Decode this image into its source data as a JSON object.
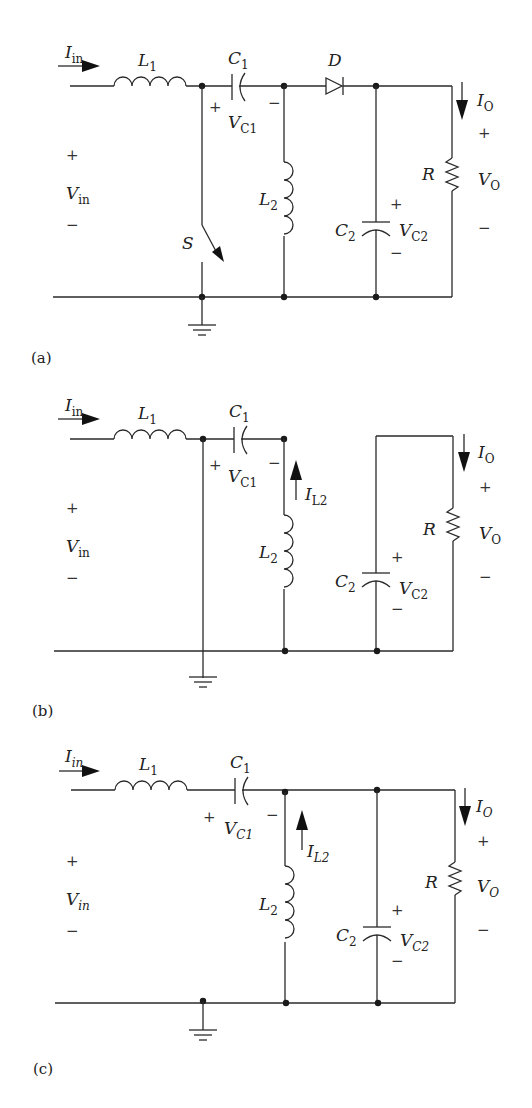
{
  "figure": {
    "panels": [
      {
        "id": "a",
        "caption": "(a)",
        "labels": {
          "iin": "I",
          "iin_sub": "in",
          "l1": "L",
          "l1_sub": "1",
          "c1": "C",
          "c1_sub": "1",
          "vc1": "V",
          "vc1_sub": "C1",
          "d": "D",
          "io": "I",
          "io_sub": "O",
          "r": "R",
          "vo": "V",
          "vo_sub": "O",
          "vin": "V",
          "vin_sub": "in",
          "s": "S",
          "l2": "L",
          "l2_sub": "2",
          "c2": "C",
          "c2_sub": "2",
          "vc2": "V",
          "vc2_sub": "C2",
          "plus": "+",
          "minus": "−"
        }
      },
      {
        "id": "b",
        "caption": "(b)",
        "labels": {
          "iin": "I",
          "iin_sub": "in",
          "l1": "L",
          "l1_sub": "1",
          "c1": "C",
          "c1_sub": "1",
          "vc1": "V",
          "vc1_sub": "C1",
          "il2": "I",
          "il2_sub": "L2",
          "io": "I",
          "io_sub": "O",
          "r": "R",
          "vo": "V",
          "vo_sub": "O",
          "vin": "V",
          "vin_sub": "in",
          "l2": "L",
          "l2_sub": "2",
          "c2": "C",
          "c2_sub": "2",
          "vc2": "V",
          "vc2_sub": "C2",
          "plus": "+",
          "minus": "−"
        }
      },
      {
        "id": "c",
        "caption": "(c)",
        "labels": {
          "iin": "I",
          "iin_sub": "in",
          "l1": "L",
          "l1_sub": "1",
          "c1": "C",
          "c1_sub": "1",
          "vc1": "V",
          "vc1_sub": "C1",
          "il2": "I",
          "il2_sub": "L2",
          "io": "I",
          "io_sub": "O",
          "r": "R",
          "vo": "V",
          "vo_sub": "O",
          "vin": "V",
          "vin_sub": "in",
          "l2": "L",
          "l2_sub": "2",
          "c2": "C",
          "c2_sub": "2",
          "vc2": "V",
          "vc2_sub": "C2",
          "plus": "+",
          "minus": "−"
        }
      }
    ]
  }
}
